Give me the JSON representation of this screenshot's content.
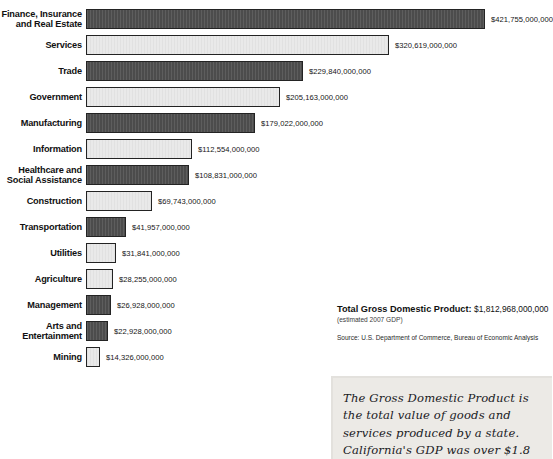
{
  "chart_data": {
    "type": "bar",
    "orientation": "horizontal",
    "title": "",
    "xlabel": "",
    "ylabel": "",
    "grid": false,
    "legend": "none",
    "axis_max_value": 421755000000,
    "categories": [
      "Finance, Insurance and Real Estate",
      "Services",
      "Trade",
      "Government",
      "Manufacturing",
      "Information",
      "Healthcare and Social Assistance",
      "Construction",
      "Transportation",
      "Utilities",
      "Agriculture",
      "Management",
      "Arts and Entertainment",
      "Mining"
    ],
    "values": [
      421755000000,
      320619000000,
      229840000000,
      205163000000,
      179022000000,
      112554000000,
      108831000000,
      69743000000,
      41957000000,
      31841000000,
      28255000000,
      26928000000,
      22928000000,
      14326000000
    ],
    "value_labels": [
      "$421,755,000,000",
      "$320,619,000,000",
      "$229,840,000,000",
      "$205,163,000,000",
      "$179,022,000,000",
      "$112,554,000,000",
      "$108,831,000,000",
      "$69,743,000,000",
      "$41,957,000,000",
      "$31,841,000,000",
      "$28,255,000,000",
      "$26,928,000,000",
      "$22,928,000,000",
      "$14,326,000,000"
    ]
  },
  "bars": [
    {
      "label_lines": [
        "Finance, Insurance",
        "and Real Estate"
      ],
      "value_label": "$421,755,000,000",
      "value": 421755000000,
      "style": "dark"
    },
    {
      "label_lines": [
        "Services"
      ],
      "value_label": "$320,619,000,000",
      "value": 320619000000,
      "style": "light"
    },
    {
      "label_lines": [
        "Trade"
      ],
      "value_label": "$229,840,000,000",
      "value": 229840000000,
      "style": "dark"
    },
    {
      "label_lines": [
        "Government"
      ],
      "value_label": "$205,163,000,000",
      "value": 205163000000,
      "style": "light"
    },
    {
      "label_lines": [
        "Manufacturing"
      ],
      "value_label": "$179,022,000,000",
      "value": 179022000000,
      "style": "dark"
    },
    {
      "label_lines": [
        "Information"
      ],
      "value_label": "$112,554,000,000",
      "value": 112554000000,
      "style": "light"
    },
    {
      "label_lines": [
        "Healthcare and",
        "Social Assistance"
      ],
      "value_label": "$108,831,000,000",
      "value": 108831000000,
      "style": "dark"
    },
    {
      "label_lines": [
        "Construction"
      ],
      "value_label": "$69,743,000,000",
      "value": 69743000000,
      "style": "light"
    },
    {
      "label_lines": [
        "Transportation"
      ],
      "value_label": "$41,957,000,000",
      "value": 41957000000,
      "style": "dark"
    },
    {
      "label_lines": [
        "Utilities"
      ],
      "value_label": "$31,841,000,000",
      "value": 31841000000,
      "style": "light"
    },
    {
      "label_lines": [
        "Agriculture"
      ],
      "value_label": "$28,255,000,000",
      "value": 28255000000,
      "style": "light"
    },
    {
      "label_lines": [
        "Management"
      ],
      "value_label": "$26,928,000,000",
      "value": 26928000000,
      "style": "dark"
    },
    {
      "label_lines": [
        "Arts and",
        "Entertainment"
      ],
      "value_label": "$22,928,000,000",
      "value": 22928000000,
      "style": "dark"
    },
    {
      "label_lines": [
        "Mining"
      ],
      "value_label": "$14,326,000,000",
      "value": 14326000000,
      "style": "light"
    }
  ],
  "totals": {
    "label": "Total Gross Domestic Product:",
    "value": "$1,812,968,000,000",
    "note": "(estimated 2007 GDP)",
    "source": "Source: U.S. Department of Commerce, Bureau of Economic Analysis"
  },
  "callout": {
    "text": "The Gross Domestic Product is the total value of goods and services produced by a state. California's GDP was over $1.8 trillion in 2007."
  },
  "colors": {
    "bar_dark": "#4c4c4c",
    "bar_light": "#e9e9e9",
    "bar_border": "#232323",
    "callout_background": "#eceae6",
    "text": "#1a1a1a"
  }
}
